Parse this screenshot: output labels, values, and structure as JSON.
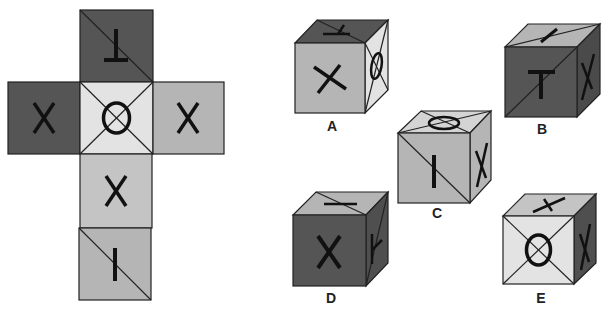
{
  "puzzle": {
    "type": "cube-net-folding",
    "colors": {
      "dark": "#555555",
      "light": "#e3e3e3",
      "mid": "#b5b5b5",
      "stroke": "#222222",
      "background": "#ffffff"
    },
    "net": {
      "faces": [
        {
          "id": "top",
          "symbol": "T",
          "rotation": 180,
          "shade": "dark",
          "diagonal": "tl-br"
        },
        {
          "id": "left",
          "symbol": "X",
          "shade": "dark"
        },
        {
          "id": "center",
          "symbol": "O",
          "shade": "light",
          "diagonal": "both"
        },
        {
          "id": "right",
          "symbol": "X",
          "shade": "mid"
        },
        {
          "id": "below",
          "symbol": "X",
          "shade": "mid"
        },
        {
          "id": "bottom",
          "symbol": "I",
          "shade": "mid",
          "diagonal": "tl-br"
        }
      ]
    },
    "options": [
      {
        "label": "A",
        "front": "X",
        "top": "T",
        "side": "O"
      },
      {
        "label": "B",
        "front": "T",
        "top": "I",
        "side": "X"
      },
      {
        "label": "C",
        "front": "I",
        "top": "O",
        "side": "X"
      },
      {
        "label": "D",
        "front": "X",
        "top": "X",
        "side": "T"
      },
      {
        "label": "E",
        "front": "O",
        "top": "X",
        "side": "X"
      }
    ]
  }
}
